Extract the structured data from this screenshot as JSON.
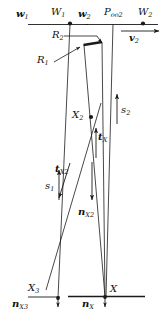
{
  "figure": {
    "type": "geometric-vector-diagram",
    "stroke_color": "#1a1a1a",
    "background": "#ffffff"
  },
  "labels": {
    "w1": {
      "base": "w",
      "sub": "1"
    },
    "W1": {
      "base": "W",
      "sub": "1"
    },
    "w2": {
      "base": "w",
      "sub": "2"
    },
    "Poo2": {
      "base": "P",
      "sub": "oo2"
    },
    "W2": {
      "base": "W",
      "sub": "2"
    },
    "v2": {
      "base": "v",
      "sub": "2"
    },
    "R2": {
      "base": "R",
      "sub": "2"
    },
    "R1": {
      "base": "R",
      "sub": "1"
    },
    "X2": {
      "base": "X",
      "sub": "2"
    },
    "s2": {
      "base": "s",
      "sub": "2"
    },
    "s1": {
      "base": "s",
      "sub": "1"
    },
    "tX": {
      "base": "t",
      "sub": "X"
    },
    "tX2": {
      "base": "t",
      "sub": "X2"
    },
    "nX2": {
      "base": "n",
      "sub": "X2"
    },
    "X3": {
      "base": "X",
      "sub": "3"
    },
    "nX3": {
      "base": "n",
      "sub": "X3"
    },
    "X": {
      "base": "X",
      "sub": ""
    },
    "nX": {
      "base": "n",
      "sub": "X"
    }
  }
}
